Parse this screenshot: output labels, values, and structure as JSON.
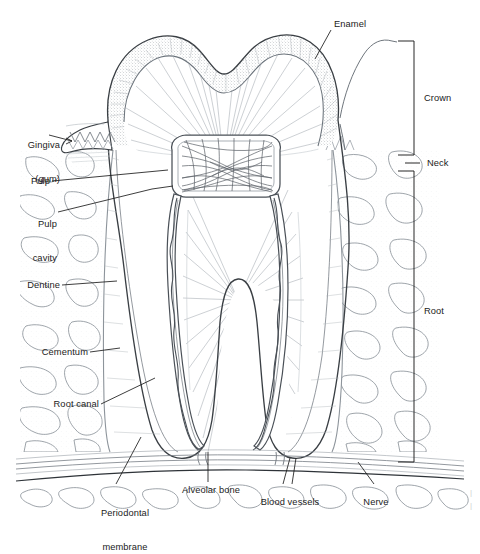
{
  "figure": {
    "style": "black-and-white line-art textbook illustration",
    "background_color": "#ffffff",
    "ink_color": "#1b1b1b",
    "stipple_color": "#9aa0a6",
    "hairline_color": "#b9bec4"
  },
  "labels": {
    "enamel": "Enamel",
    "gingiva_line1": "Gingiva",
    "gingiva_line2": "(gum)",
    "pulp": "Pulp",
    "pulp_cavity_line1": "Pulp",
    "pulp_cavity_line2": "cavity",
    "dentine": "Dentine",
    "cementum": "Cementum",
    "root_canal": "Root canal",
    "periodontal_line1": "Periodontal",
    "periodontal_line2": "membrane",
    "alveolar_bone": "Alveolar bone",
    "blood_vessels": "Blood vessels",
    "nerve": "Nerve"
  },
  "brackets": {
    "crown": "Crown",
    "neck": "Neck",
    "root": "Root"
  },
  "label_list": [
    {
      "name": "enamel",
      "text": "Enamel",
      "side": "top-right"
    },
    {
      "name": "gingiva",
      "text": "Gingiva (gum)",
      "side": "left"
    },
    {
      "name": "pulp",
      "text": "Pulp",
      "side": "left"
    },
    {
      "name": "pulp-cavity",
      "text": "Pulp cavity",
      "side": "left"
    },
    {
      "name": "dentine",
      "text": "Dentine",
      "side": "left"
    },
    {
      "name": "cementum",
      "text": "Cementum",
      "side": "left"
    },
    {
      "name": "root-canal",
      "text": "Root canal",
      "side": "left"
    },
    {
      "name": "periodontal-membrane",
      "text": "Periodontal membrane",
      "side": "bottom"
    },
    {
      "name": "alveolar-bone",
      "text": "Alveolar bone",
      "side": "bottom"
    },
    {
      "name": "blood-vessels",
      "text": "Blood vessels",
      "side": "bottom"
    },
    {
      "name": "nerve",
      "text": "Nerve",
      "side": "bottom"
    },
    {
      "name": "crown",
      "text": "Crown",
      "side": "right-bracket"
    },
    {
      "name": "neck",
      "text": "Neck",
      "side": "right-bracket"
    },
    {
      "name": "root",
      "text": "Root",
      "side": "right-bracket"
    }
  ]
}
